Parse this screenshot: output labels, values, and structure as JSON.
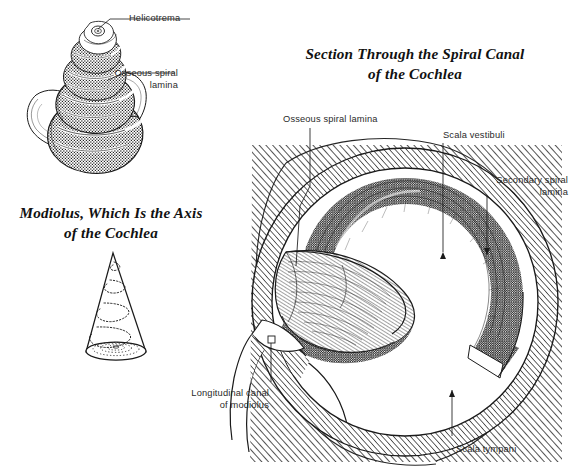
{
  "plate": {
    "kind": "anatomical-illustration",
    "subject": "Cochlea",
    "background_color": "#ffffff",
    "ink_color": "#1a1a1a"
  },
  "figures": {
    "shell": {
      "name": "Cochlea spiral shell (whole, external view)",
      "labels": [
        {
          "id": "helicotrema",
          "text": "Helicotrema"
        },
        {
          "id": "osseous-lamina-shell",
          "text": "Osseous spiral\nlamina"
        }
      ]
    },
    "modiolus": {
      "title": "Modiolus, Which Is the Axis\nof the Cochlea",
      "name": "Modiolus cone"
    },
    "section": {
      "title": "Section Through the Spiral Canal\nof the Cochlea",
      "name": "Spiral canal cross-section",
      "labels": [
        {
          "id": "osseous-spiral-lamina",
          "text": "Osseous spiral lamina",
          "align": "left"
        },
        {
          "id": "scala-vestibuli",
          "text": "Scala vestibuli",
          "align": "left"
        },
        {
          "id": "secondary-spiral-lamina",
          "text": "Secondary spiral\nlamina",
          "align": "right"
        },
        {
          "id": "longitudinal-canal",
          "text": "Longitudinal canal\nof modiolus",
          "align": "right"
        },
        {
          "id": "scala-tympani",
          "text": "Scala tympani",
          "align": "left"
        }
      ]
    }
  }
}
